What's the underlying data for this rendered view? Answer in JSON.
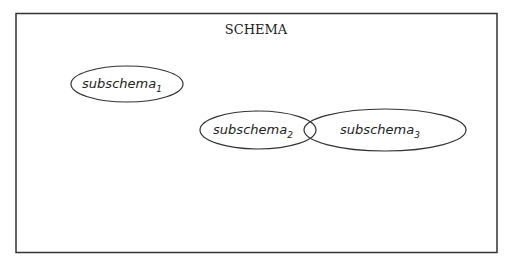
{
  "diagram": {
    "title": "SCHEMA",
    "colors": {
      "stroke": "#333333",
      "background": "#ffffff",
      "text": "#222222"
    },
    "nodes": [
      {
        "id": "subschema1",
        "base": "subschema",
        "subscript": "1"
      },
      {
        "id": "subschema2",
        "base": "subschema",
        "subscript": "2"
      },
      {
        "id": "subschema3",
        "base": "subschema",
        "subscript": "3"
      }
    ],
    "relations": [
      {
        "type": "overlap",
        "between": [
          "subschema2",
          "subschema3"
        ]
      }
    ]
  }
}
